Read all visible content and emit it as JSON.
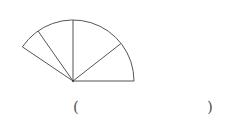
{
  "diagram": {
    "type": "sector-fan",
    "center": [
      73,
      81
    ],
    "radius": 61,
    "stroke_color": "#555555",
    "ray_angles_deg": [
      0,
      38,
      90,
      125,
      146
    ]
  },
  "answer_blank": {
    "open": "(",
    "close": ")",
    "value": ""
  }
}
